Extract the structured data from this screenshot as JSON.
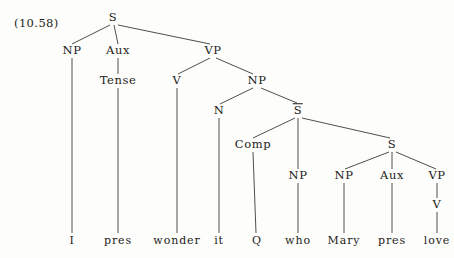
{
  "figure": {
    "caption": "(10.58)",
    "caption_x": 14,
    "caption_y": 16,
    "width": 454,
    "height": 258,
    "background": "#fdfdfb",
    "ink": "#1c1c1a",
    "edge_color": "#3a3a38",
    "type": "syntax-tree"
  },
  "chart_data": {
    "type": "tree",
    "title": "(10.58)",
    "sentence": "I pres wonder it Q who Mary pres love",
    "nodes": [
      {
        "id": "S_root",
        "label": "S",
        "overline": false,
        "x": 113,
        "y": 18,
        "level": 0
      },
      {
        "id": "NP1",
        "label": "NP",
        "overline": false,
        "x": 72,
        "y": 51,
        "level": 1
      },
      {
        "id": "Aux1",
        "label": "Aux",
        "overline": false,
        "x": 118,
        "y": 51,
        "level": 1
      },
      {
        "id": "VP1",
        "label": "VP",
        "overline": false,
        "x": 213,
        "y": 51,
        "level": 1
      },
      {
        "id": "Tense1",
        "label": "Tense",
        "overline": false,
        "x": 118,
        "y": 81,
        "level": 2
      },
      {
        "id": "V1",
        "label": "V",
        "overline": false,
        "x": 177,
        "y": 81,
        "level": 2
      },
      {
        "id": "NP2",
        "label": "NP",
        "overline": false,
        "x": 257,
        "y": 81,
        "level": 2
      },
      {
        "id": "N1",
        "label": "N",
        "overline": false,
        "x": 219,
        "y": 111,
        "level": 3
      },
      {
        "id": "Sbar",
        "label": "S",
        "overline": true,
        "x": 298,
        "y": 111,
        "level": 3
      },
      {
        "id": "Comp1",
        "label": "Comp",
        "overline": false,
        "x": 253,
        "y": 145,
        "level": 4
      },
      {
        "id": "S_low",
        "label": "S",
        "overline": false,
        "x": 392,
        "y": 145,
        "level": 4
      },
      {
        "id": "NP3",
        "label": "NP",
        "overline": false,
        "x": 298,
        "y": 176,
        "level": 5
      },
      {
        "id": "NP4",
        "label": "NP",
        "overline": false,
        "x": 344,
        "y": 176,
        "level": 5
      },
      {
        "id": "Aux2",
        "label": "Aux",
        "overline": false,
        "x": 392,
        "y": 176,
        "level": 5
      },
      {
        "id": "VP2",
        "label": "VP",
        "overline": false,
        "x": 437,
        "y": 176,
        "level": 5
      },
      {
        "id": "V2",
        "label": "V",
        "overline": false,
        "x": 437,
        "y": 205,
        "level": 6
      }
    ],
    "terminals": [
      {
        "id": "t_I",
        "label": "I",
        "x": 72,
        "y": 240,
        "parent": "NP1"
      },
      {
        "id": "t_pres1",
        "label": "pres",
        "x": 118,
        "y": 240,
        "parent": "Tense1"
      },
      {
        "id": "t_wonder",
        "label": "wonder",
        "x": 177,
        "y": 240,
        "parent": "V1"
      },
      {
        "id": "t_it",
        "label": "it",
        "x": 219,
        "y": 240,
        "parent": "N1"
      },
      {
        "id": "t_Q",
        "label": "Q",
        "x": 257,
        "y": 240,
        "parent": "Comp1"
      },
      {
        "id": "t_who",
        "label": "who",
        "x": 298,
        "y": 240,
        "parent": "NP3"
      },
      {
        "id": "t_Mary",
        "label": "Mary",
        "x": 344,
        "y": 240,
        "parent": "NP4"
      },
      {
        "id": "t_pres2",
        "label": "pres",
        "x": 392,
        "y": 240,
        "parent": "Aux2"
      },
      {
        "id": "t_love",
        "label": "love",
        "x": 437,
        "y": 240,
        "parent": "V2"
      }
    ],
    "edges": [
      {
        "from": "S_root",
        "to": "NP1",
        "x1": 110,
        "y1": 25,
        "x2": 72,
        "y2": 44
      },
      {
        "from": "S_root",
        "to": "Aux1",
        "x1": 114,
        "y1": 25,
        "x2": 118,
        "y2": 44
      },
      {
        "from": "S_root",
        "to": "VP1",
        "x1": 118,
        "y1": 25,
        "x2": 210,
        "y2": 44
      },
      {
        "from": "NP1",
        "to": "t_I",
        "x1": 72,
        "y1": 58,
        "x2": 72,
        "y2": 233
      },
      {
        "from": "Aux1",
        "to": "Tense1",
        "x1": 118,
        "y1": 58,
        "x2": 118,
        "y2": 74
      },
      {
        "from": "Tense1",
        "to": "t_pres1",
        "x1": 118,
        "y1": 88,
        "x2": 118,
        "y2": 233
      },
      {
        "from": "VP1",
        "to": "V1",
        "x1": 210,
        "y1": 58,
        "x2": 178,
        "y2": 74
      },
      {
        "from": "VP1",
        "to": "NP2",
        "x1": 216,
        "y1": 58,
        "x2": 253,
        "y2": 74
      },
      {
        "from": "V1",
        "to": "t_wonder",
        "x1": 177,
        "y1": 88,
        "x2": 177,
        "y2": 233
      },
      {
        "from": "NP2",
        "to": "N1",
        "x1": 253,
        "y1": 88,
        "x2": 220,
        "y2": 104
      },
      {
        "from": "NP2",
        "to": "Sbar",
        "x1": 261,
        "y1": 88,
        "x2": 297,
        "y2": 103
      },
      {
        "from": "N1",
        "to": "t_it",
        "x1": 219,
        "y1": 118,
        "x2": 219,
        "y2": 233
      },
      {
        "from": "Sbar",
        "to": "Comp1",
        "x1": 295,
        "y1": 118,
        "x2": 253,
        "y2": 138
      },
      {
        "from": "Sbar",
        "to": "NP3",
        "x1": 298,
        "y1": 118,
        "x2": 298,
        "y2": 169
      },
      {
        "from": "Sbar",
        "to": "S_low",
        "x1": 302,
        "y1": 118,
        "x2": 390,
        "y2": 138
      },
      {
        "from": "Comp1",
        "to": "t_Q",
        "x1": 253,
        "y1": 152,
        "x2": 256,
        "y2": 233
      },
      {
        "from": "NP3",
        "to": "t_who",
        "x1": 298,
        "y1": 183,
        "x2": 298,
        "y2": 233
      },
      {
        "from": "S_low",
        "to": "NP4",
        "x1": 389,
        "y1": 152,
        "x2": 345,
        "y2": 169
      },
      {
        "from": "S_low",
        "to": "Aux2",
        "x1": 392,
        "y1": 152,
        "x2": 392,
        "y2": 169
      },
      {
        "from": "S_low",
        "to": "VP2",
        "x1": 396,
        "y1": 152,
        "x2": 436,
        "y2": 169
      },
      {
        "from": "NP4",
        "to": "t_Mary",
        "x1": 344,
        "y1": 183,
        "x2": 344,
        "y2": 233
      },
      {
        "from": "Aux2",
        "to": "t_pres2",
        "x1": 392,
        "y1": 183,
        "x2": 392,
        "y2": 233
      },
      {
        "from": "VP2",
        "to": "V2",
        "x1": 437,
        "y1": 183,
        "x2": 437,
        "y2": 198
      },
      {
        "from": "V2",
        "to": "t_love",
        "x1": 437,
        "y1": 212,
        "x2": 437,
        "y2": 233
      }
    ]
  }
}
